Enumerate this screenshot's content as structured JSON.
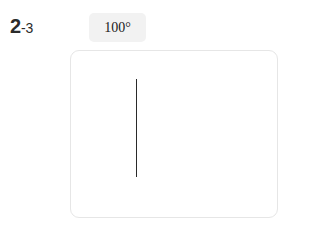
{
  "figure": {
    "index_major": "2",
    "index_minor": "-3"
  },
  "angle_chip": {
    "value": "100°"
  },
  "canvas": {
    "ray_name": "vertical-ray"
  },
  "colors": {
    "page_background": "#ffffff",
    "card_background": "#ffffff",
    "card_border": "#e6e6e6",
    "chip_background": "#f2f2f2",
    "ray_stroke": "#2a2a2a",
    "label_text": "#2b2b2b",
    "chip_text": "#1a1a1a"
  }
}
